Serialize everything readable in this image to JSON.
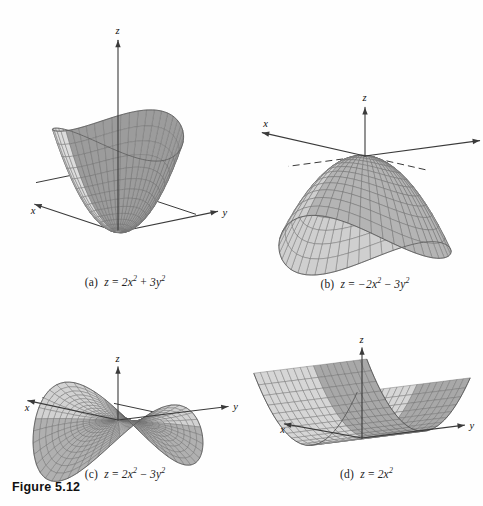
{
  "figure": {
    "label": "Figure 5.12",
    "panels": [
      {
        "id": "a",
        "tag": "(a)",
        "equation_plain": "z = 2x^2 + 3y^2",
        "lhs": "z",
        "eq": "=",
        "terms": [
          "2x",
          "2",
          "+",
          "3y",
          "2"
        ],
        "surface_type": "elliptic-paraboloid-up",
        "axes": [
          "x",
          "y",
          "z"
        ],
        "colors": {
          "inner": "#9c9c9c",
          "outer": "#dcdcdc",
          "mesh": "#6f6f6f",
          "axis": "#3a3a3a"
        }
      },
      {
        "id": "b",
        "tag": "(b)",
        "equation_plain": "z = -2x^2 - 3y^2",
        "lhs": "z",
        "eq": "=",
        "terms": [
          "−2x",
          "2",
          "−",
          "3y",
          "2"
        ],
        "surface_type": "elliptic-paraboloid-down",
        "axes": [
          "x",
          "y",
          "z"
        ],
        "colors": {
          "inner": "#b4b4b4",
          "outer": "#cfcfcf",
          "mesh": "#6b6b6b",
          "axis": "#3a3a3a"
        }
      },
      {
        "id": "c",
        "tag": "(c)",
        "equation_plain": "z = 2x^2 - 3y^2",
        "lhs": "z",
        "eq": "=",
        "terms": [
          "2x",
          "2",
          "−",
          "3y",
          "2"
        ],
        "surface_type": "hyperbolic-paraboloid",
        "axes": [
          "x",
          "y",
          "z"
        ],
        "colors": {
          "inner": "#b0b0b0",
          "outer": "#d2d2d2",
          "mesh": "#6b6b6b",
          "axis": "#3a3a3a"
        }
      },
      {
        "id": "d",
        "tag": "(d)",
        "equation_plain": "z = 2x^2",
        "lhs": "z",
        "eq": "=",
        "terms": [
          "2x",
          "2",
          "",
          "",
          ""
        ],
        "surface_type": "parabolic-cylinder",
        "axes": [
          "x",
          "y",
          "z"
        ],
        "colors": {
          "inner": "#a8a8a8",
          "outer": "#d6d6d6",
          "mesh": "#6b6b6b",
          "axis": "#3a3a3a"
        }
      }
    ]
  },
  "chart_data": [
    {
      "type": "surface",
      "panel": "a",
      "title": "z = 2x^2 + 3y^2",
      "equation": "z = 2*x**2 + 3*y**2",
      "xlabel": "x",
      "ylabel": "y",
      "zlabel": "z",
      "xlim": [
        -1.6,
        1.6
      ],
      "ylim": [
        -1.3,
        1.3
      ],
      "zlim": [
        0,
        5.2
      ],
      "grid": true,
      "legend": false,
      "description": "Elliptic paraboloid opening upward, vertex at origin"
    },
    {
      "type": "surface",
      "panel": "b",
      "title": "z = -2x^2 - 3y^2",
      "equation": "z = -2*x**2 - 3*y**2",
      "xlabel": "x",
      "ylabel": "y",
      "zlabel": "z",
      "xlim": [
        -1.6,
        1.6
      ],
      "ylim": [
        -1.4,
        1.4
      ],
      "zlim": [
        -5.2,
        0
      ],
      "grid": true,
      "legend": false,
      "description": "Elliptic paraboloid opening downward, vertex at origin"
    },
    {
      "type": "surface",
      "panel": "c",
      "title": "z = 2x^2 - 3y^2",
      "equation": "z = 2*x**2 - 3*y**2",
      "xlabel": "x",
      "ylabel": "y",
      "zlabel": "z",
      "xlim": [
        -1.4,
        1.4
      ],
      "ylim": [
        -1.4,
        1.4
      ],
      "zlim": [
        -3.0,
        3.0
      ],
      "grid": true,
      "legend": false,
      "description": "Hyperbolic paraboloid (saddle) through origin"
    },
    {
      "type": "surface",
      "panel": "d",
      "title": "z = 2x^2",
      "equation": "z = 2*x**2",
      "xlabel": "x",
      "ylabel": "y",
      "zlabel": "z",
      "xlim": [
        -1.5,
        1.5
      ],
      "ylim": [
        -1.5,
        1.5
      ],
      "zlim": [
        0,
        4.5
      ],
      "grid": true,
      "legend": false,
      "description": "Parabolic cylinder, parabola in xz-plane extended along y"
    }
  ]
}
